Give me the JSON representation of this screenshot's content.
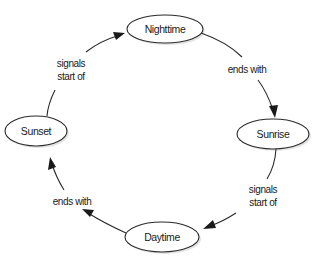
{
  "diagram": {
    "type": "cycle",
    "nodes": [
      {
        "id": "nighttime",
        "label": "Nighttime"
      },
      {
        "id": "sunrise",
        "label": "Sunrise"
      },
      {
        "id": "daytime",
        "label": "Daytime"
      },
      {
        "id": "sunset",
        "label": "Sunset"
      }
    ],
    "edges": [
      {
        "from": "sunset",
        "to": "nighttime",
        "label_line1": "signals",
        "label_line2": "start of"
      },
      {
        "from": "nighttime",
        "to": "sunrise",
        "label_line1": "ends with"
      },
      {
        "from": "sunrise",
        "to": "daytime",
        "label_line1": "signals",
        "label_line2": "start of"
      },
      {
        "from": "daytime",
        "to": "sunset",
        "label_line1": "ends with"
      }
    ]
  }
}
